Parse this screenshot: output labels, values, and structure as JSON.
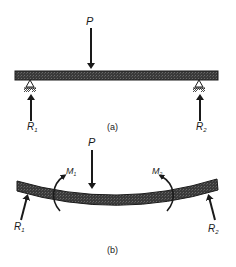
{
  "figure": {
    "part_a": {
      "caption": "(a)",
      "load_label": "P",
      "reaction_left": {
        "main": "R",
        "sub": "1"
      },
      "reaction_right": {
        "main": "R",
        "sub": "2"
      }
    },
    "part_b": {
      "caption": "(b)",
      "load_label": "P",
      "moment_left": {
        "main": "M",
        "sub": "1"
      },
      "moment_right": {
        "main": "M",
        "sub": "2"
      },
      "reaction_left": {
        "main": "R",
        "sub": "1"
      },
      "reaction_right": {
        "main": "R",
        "sub": "2"
      }
    },
    "colors": {
      "ink": "#1a1a1a",
      "beam_fill": "#3a3a3a",
      "background": "#ffffff"
    }
  }
}
